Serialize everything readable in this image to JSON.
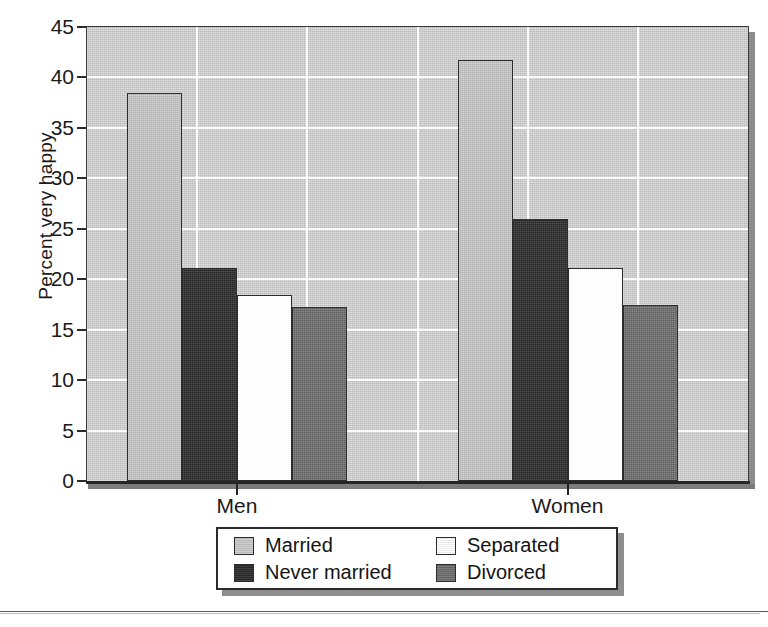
{
  "chart_data": {
    "type": "bar",
    "title": "",
    "xlabel": "",
    "ylabel": "Percent very happy",
    "categories": [
      "Men",
      "Women"
    ],
    "series": [
      {
        "name": "Married",
        "values": [
          38.5,
          41.7
        ],
        "color": "#c9c9c9"
      },
      {
        "name": "Never married",
        "values": [
          21.1,
          26.0
        ],
        "color": "#2a2a2a"
      },
      {
        "name": "Separated",
        "values": [
          18.4,
          21.1
        ],
        "color": "#ffffff"
      },
      {
        "name": "Divorced",
        "values": [
          17.2,
          17.4
        ],
        "color": "#6d6d6d"
      }
    ],
    "ylim": [
      0,
      45
    ],
    "yticks": [
      0,
      5,
      10,
      15,
      20,
      25,
      30,
      35,
      40,
      45
    ],
    "ytick_labels": [
      "0",
      "5",
      "10",
      "15",
      "20",
      "25",
      "30",
      "35",
      "40",
      "45"
    ],
    "grid": true,
    "grid_axis": "both",
    "legend_position": "bottom",
    "plot_background": "#cdcdcd",
    "gridline_color": "#ffffff"
  },
  "legend": {
    "entries": [
      {
        "label": "Married"
      },
      {
        "label": "Separated"
      },
      {
        "label": "Never married"
      },
      {
        "label": "Divorced"
      }
    ]
  },
  "axis": {
    "y_title": "Percent very happy",
    "x_labels": [
      "Men",
      "Women"
    ]
  }
}
